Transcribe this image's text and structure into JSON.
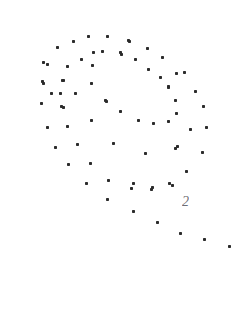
{
  "image": {
    "width": 244,
    "height": 321,
    "background_color": "#ffffff",
    "description": "scanned scatter of small dark dots forming an inward spiral, with a handwritten numeral label"
  },
  "label": {
    "text": "2",
    "x": 182,
    "y": 209,
    "font_size": 14,
    "color": "#55555c"
  },
  "chart_data": {
    "type": "scatter",
    "title": "",
    "subtitle": "",
    "xlabel": "",
    "ylabel": "",
    "xlim": [
      0,
      244
    ],
    "ylim": [
      0,
      321
    ],
    "grid": false,
    "legend": "none",
    "annotations": [
      {
        "text": "2",
        "x": 182,
        "y": 209
      }
    ],
    "marker": {
      "shape": "square",
      "size_px": 3,
      "color": "#2b2b2b"
    },
    "series": [
      {
        "name": "points",
        "color": "#2b2b2b",
        "points": [
          [
            73,
            41
          ],
          [
            88,
            36
          ],
          [
            107,
            36
          ],
          [
            128,
            40
          ],
          [
            57,
            47
          ],
          [
            93,
            52
          ],
          [
            102,
            51
          ],
          [
            121,
            54
          ],
          [
            129,
            41
          ],
          [
            147,
            48
          ],
          [
            43,
            62
          ],
          [
            47,
            64
          ],
          [
            67,
            66
          ],
          [
            81,
            59
          ],
          [
            92,
            65
          ],
          [
            120,
            52
          ],
          [
            135,
            59
          ],
          [
            162,
            57
          ],
          [
            42,
            81
          ],
          [
            62,
            80
          ],
          [
            63,
            80
          ],
          [
            148,
            69
          ],
          [
            176,
            73
          ],
          [
            184,
            72
          ],
          [
            43,
            83
          ],
          [
            91,
            83
          ],
          [
            160,
            77
          ],
          [
            168,
            86
          ],
          [
            51,
            93
          ],
          [
            60,
            93
          ],
          [
            75,
            93
          ],
          [
            168,
            87
          ],
          [
            195,
            91
          ],
          [
            41,
            103
          ],
          [
            61,
            106
          ],
          [
            63,
            107
          ],
          [
            105,
            100
          ],
          [
            106,
            101
          ],
          [
            175,
            100
          ],
          [
            203,
            106
          ],
          [
            120,
            111
          ],
          [
            168,
            121
          ],
          [
            176,
            113
          ],
          [
            206,
            127
          ],
          [
            47,
            127
          ],
          [
            67,
            126
          ],
          [
            91,
            120
          ],
          [
            138,
            120
          ],
          [
            153,
            123
          ],
          [
            190,
            129
          ],
          [
            55,
            147
          ],
          [
            77,
            144
          ],
          [
            113,
            143
          ],
          [
            145,
            153
          ],
          [
            175,
            148
          ],
          [
            202,
            152
          ],
          [
            177,
            146
          ],
          [
            68,
            164
          ],
          [
            90,
            163
          ],
          [
            186,
            171
          ],
          [
            86,
            183
          ],
          [
            108,
            180
          ],
          [
            133,
            183
          ],
          [
            152,
            187
          ],
          [
            169,
            183
          ],
          [
            107,
            199
          ],
          [
            131,
            188
          ],
          [
            151,
            189
          ],
          [
            172,
            185
          ],
          [
            133,
            211
          ],
          [
            157,
            222
          ],
          [
            180,
            233
          ],
          [
            204,
            239
          ],
          [
            229,
            246
          ]
        ]
      }
    ]
  }
}
